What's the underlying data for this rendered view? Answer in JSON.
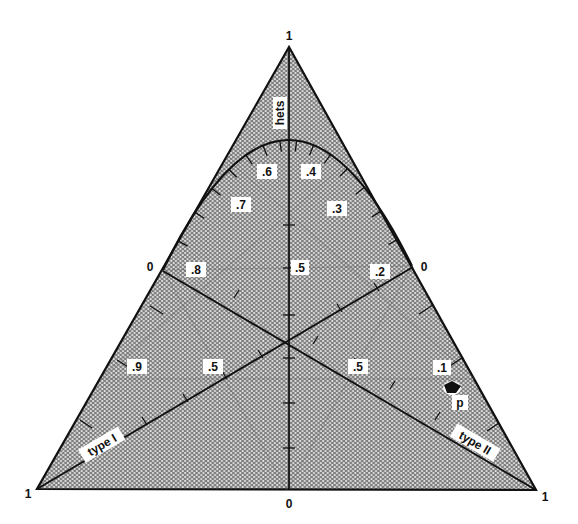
{
  "diagram": {
    "type": "ternary",
    "vertices": {
      "top": "1",
      "bottom_left": "1",
      "bottom_right": "1"
    },
    "axis_labels": {
      "vertical": "hets",
      "left_line": "type I",
      "right_line": "type II"
    },
    "edge_zero_labels": {
      "bottom": "0",
      "left": "0",
      "right": "0"
    },
    "curve_labels": [
      ".6",
      ".4",
      ".7",
      ".3",
      ".8",
      ".2"
    ],
    "center_label": ".5",
    "lower_labels": {
      "left_outer": ".9",
      "left_inner": ".5",
      "right_inner": ".5",
      "right_outer": ".1"
    },
    "point_marker": {
      "label": "p",
      "icon": "arrow-pointer-icon"
    },
    "colors": {
      "line": "#111111",
      "fill_base": "#8c8c8c",
      "fill_dot": "#e8e8e8",
      "label_bg": "#ffffff"
    }
  }
}
